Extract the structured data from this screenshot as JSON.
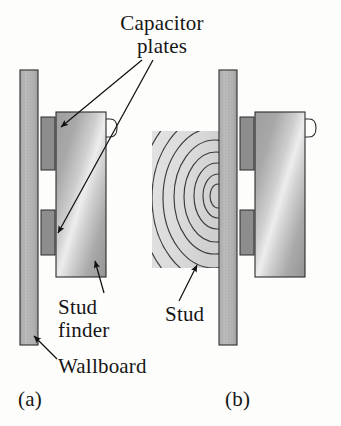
{
  "figure": {
    "type": "physics-textbook-diagram",
    "background_color": "#fdfdfc"
  },
  "labels": {
    "capacitor_plates": "Capacitor\nplates",
    "stud_finder": "Stud\nfinder",
    "wallboard": "Wallboard",
    "stud": "Stud",
    "panel_a": "(a)",
    "panel_b": "(b)"
  },
  "colors": {
    "wallboard_fill": "#b5b5b5",
    "wallboard_stroke": "#2b2b2b",
    "plate_fill": "#8d8d8d",
    "plate_stroke": "#2b2b2b",
    "finder_body_light": "#e4e4e4",
    "finder_body_dark": "#9a9a9a",
    "finder_stroke": "#2b2b2b",
    "stud_fill": "#dcdcdc",
    "stud_grain_stroke": "#3a3a3a",
    "leader_line": "#111111",
    "text": "#161616",
    "background": "#fdfdfc"
  },
  "panels": [
    {
      "id": "a",
      "caption": "(a)",
      "description": "Stud finder held against wallboard where there is no stud behind it",
      "parts": [
        {
          "name": "wallboard",
          "x": 20,
          "y": 70,
          "width": 18,
          "height": 275
        },
        {
          "name": "capacitor-plate-upper",
          "x": 41,
          "y": 117,
          "width": 13,
          "height": 53
        },
        {
          "name": "capacitor-plate-lower",
          "x": 41,
          "y": 210,
          "width": 13,
          "height": 45
        },
        {
          "name": "stud-finder-body",
          "x": 56,
          "y": 112,
          "width": 50,
          "height": 165
        },
        {
          "name": "stud-finder-handle",
          "x": 106,
          "y": 119,
          "width": 10,
          "height": 18
        }
      ]
    },
    {
      "id": "b",
      "caption": "(b)",
      "description": "Stud finder held against wallboard with a wooden stud directly behind it",
      "parts": [
        {
          "name": "stud",
          "x": 152,
          "y": 131,
          "width": 68,
          "height": 137
        },
        {
          "name": "wallboard",
          "x": 219,
          "y": 70,
          "width": 18,
          "height": 275
        },
        {
          "name": "capacitor-plate-upper",
          "x": 240,
          "y": 117,
          "width": 13,
          "height": 53
        },
        {
          "name": "capacitor-plate-lower",
          "x": 240,
          "y": 210,
          "width": 13,
          "height": 45
        },
        {
          "name": "stud-finder-body",
          "x": 255,
          "y": 112,
          "width": 50,
          "height": 165
        },
        {
          "name": "stud-finder-handle",
          "x": 305,
          "y": 119,
          "width": 10,
          "height": 18
        }
      ]
    }
  ],
  "leaders": [
    {
      "name": "capacitor-plates-to-upper-plate",
      "from": [
        140,
        62
      ],
      "to": [
        56,
        128
      ]
    },
    {
      "name": "capacitor-plates-to-lower-plate",
      "from": [
        152,
        62
      ],
      "to": [
        54,
        232
      ]
    },
    {
      "name": "stud-finder-to-body",
      "from": [
        103,
        292
      ],
      "to": [
        94,
        262
      ]
    },
    {
      "name": "wallboard-to-board",
      "from": [
        56,
        358
      ],
      "to": [
        35,
        336
      ]
    },
    {
      "name": "stud-to-block",
      "from": [
        180,
        300
      ],
      "to": [
        196,
        266
      ]
    }
  ]
}
